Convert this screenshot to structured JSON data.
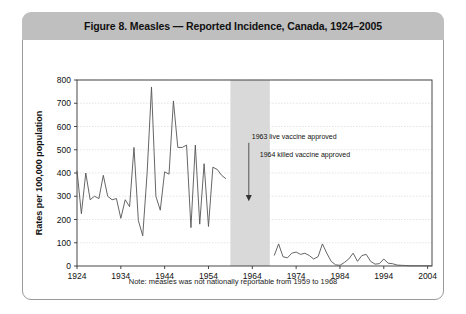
{
  "figure": {
    "title": "Figure 8. Measles — Reported Incidence, Canada, 1924–2005",
    "footnote": "Note: measles was not nationally reportable from 1959 to 1968"
  },
  "colors": {
    "header_bar": "#bfbfbf",
    "panel_border": "#9a9a9a",
    "line": "#555555",
    "grid": "#d8d8d8",
    "axis": "#333333",
    "shaded_band": "#d9d9d9",
    "text": "#111111"
  },
  "annotations": [
    {
      "name": "live-vaccine",
      "text": "1963 live vaccine approved",
      "year": 1963
    },
    {
      "name": "killed-vaccine",
      "text": "1964 killed vaccine approved",
      "year": 1964
    }
  ],
  "chart_data": {
    "type": "line",
    "title": "Figure 8. Measles — Reported Incidence, Canada, 1924–2005",
    "xlabel": "",
    "ylabel": "Rates per 100,000 population",
    "xlim": [
      1924,
      2005
    ],
    "ylim": [
      0,
      800
    ],
    "ytick_values": [
      0,
      100,
      200,
      300,
      400,
      500,
      600,
      700,
      800
    ],
    "xtick_values": [
      1924,
      1934,
      1944,
      1954,
      1964,
      1974,
      1984,
      1994,
      2004
    ],
    "grid": true,
    "legend": "none",
    "shaded_bands": [
      {
        "label": "not nationally reportable",
        "x_start": 1959,
        "x_end": 1968,
        "color": "#d9d9d9"
      }
    ],
    "series": [
      {
        "name": "Reported incidence per 100,000 (1924-1958)",
        "x": [
          1924,
          1925,
          1926,
          1927,
          1928,
          1929,
          1930,
          1931,
          1932,
          1933,
          1934,
          1935,
          1936,
          1937,
          1938,
          1939,
          1940,
          1941,
          1942,
          1943,
          1944,
          1945,
          1946,
          1947,
          1948,
          1949,
          1950,
          1951,
          1952,
          1953,
          1954,
          1955,
          1956,
          1957,
          1958
        ],
        "values": [
          410,
          225,
          400,
          285,
          300,
          290,
          390,
          300,
          285,
          290,
          205,
          285,
          255,
          510,
          195,
          130,
          400,
          770,
          300,
          240,
          405,
          395,
          710,
          510,
          510,
          520,
          165,
          520,
          180,
          440,
          170,
          425,
          415,
          390,
          375
        ]
      },
      {
        "name": "Reported incidence per 100,000 (1969-2005)",
        "x": [
          1969,
          1970,
          1971,
          1972,
          1973,
          1974,
          1975,
          1976,
          1977,
          1978,
          1979,
          1980,
          1981,
          1982,
          1983,
          1984,
          1985,
          1986,
          1987,
          1988,
          1989,
          1990,
          1991,
          1992,
          1993,
          1994,
          1995,
          1996,
          1997,
          1998,
          1999,
          2000,
          2001,
          2002,
          2003,
          2004,
          2005
        ],
        "values": [
          45,
          95,
          40,
          35,
          55,
          60,
          50,
          55,
          45,
          30,
          40,
          95,
          55,
          20,
          5,
          3,
          15,
          30,
          55,
          20,
          45,
          50,
          20,
          8,
          10,
          30,
          12,
          10,
          4,
          3,
          2,
          1,
          1,
          1,
          1,
          1,
          1
        ]
      }
    ],
    "gap_note": "No data plotted 1959-1968 (shaded band); measles was not nationally reportable"
  }
}
